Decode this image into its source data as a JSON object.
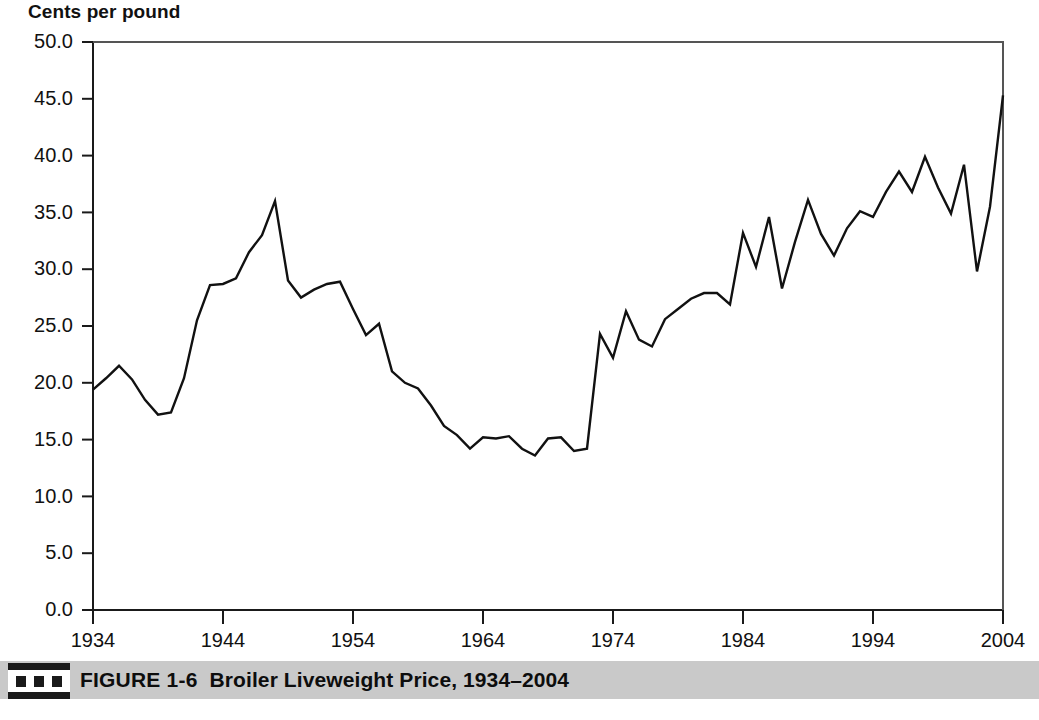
{
  "figure": {
    "axis_title": "Cents per pound",
    "caption_number": "FIGURE 1-6",
    "caption_title": "Broiler Liveweight Price, 1934–2004",
    "caption_icon_name": "three-squares-bullet",
    "caption_band_color": "#c9c9c9",
    "line_color": "#111111",
    "background_color": "#ffffff"
  },
  "chart_data": {
    "type": "line",
    "title": "Broiler Liveweight Price, 1934–2004",
    "xlabel": "",
    "ylabel": "Cents per pound",
    "ylim": [
      0.0,
      50.0
    ],
    "xlim": [
      1934,
      2004
    ],
    "ytick_labels": [
      "0.0",
      "5.0",
      "10.0",
      "15.0",
      "20.0",
      "25.0",
      "30.0",
      "35.0",
      "40.0",
      "45.0",
      "50.0"
    ],
    "ytick_values": [
      0.0,
      5.0,
      10.0,
      15.0,
      20.0,
      25.0,
      30.0,
      35.0,
      40.0,
      45.0,
      50.0
    ],
    "xtick_labels": [
      "1934",
      "1944",
      "1954",
      "1964",
      "1974",
      "1984",
      "1994",
      "2004"
    ],
    "xtick_values": [
      1934,
      1944,
      1954,
      1964,
      1974,
      1984,
      1994,
      2004
    ],
    "grid": false,
    "legend": false,
    "series": [
      {
        "name": "Broiler liveweight price",
        "x": [
          1934,
          1935,
          1936,
          1937,
          1938,
          1939,
          1940,
          1941,
          1942,
          1943,
          1944,
          1945,
          1946,
          1947,
          1948,
          1949,
          1950,
          1951,
          1952,
          1953,
          1954,
          1955,
          1956,
          1957,
          1958,
          1959,
          1960,
          1961,
          1962,
          1963,
          1964,
          1965,
          1966,
          1967,
          1968,
          1969,
          1970,
          1971,
          1972,
          1973,
          1974,
          1975,
          1976,
          1977,
          1978,
          1979,
          1980,
          1981,
          1982,
          1983,
          1984,
          1985,
          1986,
          1987,
          1988,
          1989,
          1990,
          1991,
          1992,
          1993,
          1994,
          1995,
          1996,
          1997,
          1998,
          1999,
          2000,
          2001,
          2002,
          2003,
          2004
        ],
        "values": [
          19.4,
          20.4,
          21.5,
          20.3,
          18.5,
          17.2,
          17.4,
          20.4,
          25.5,
          28.6,
          28.7,
          29.2,
          31.5,
          33.0,
          36.0,
          29.0,
          27.5,
          28.2,
          28.7,
          28.9,
          26.5,
          24.2,
          25.2,
          21.0,
          20.0,
          19.5,
          18.0,
          16.2,
          15.4,
          14.2,
          15.2,
          15.1,
          15.3,
          14.2,
          13.6,
          15.1,
          15.2,
          14.0,
          14.2,
          24.3,
          22.2,
          26.3,
          23.8,
          23.2,
          25.6,
          26.5,
          27.4,
          27.9,
          27.9,
          26.9,
          33.2,
          30.2,
          34.6,
          28.3,
          32.4,
          36.1,
          33.1,
          31.2,
          33.6,
          35.1,
          34.6,
          36.8,
          38.6,
          36.8,
          39.9,
          37.2,
          34.9,
          39.2,
          29.8,
          35.5,
          45.3
        ]
      }
    ]
  }
}
